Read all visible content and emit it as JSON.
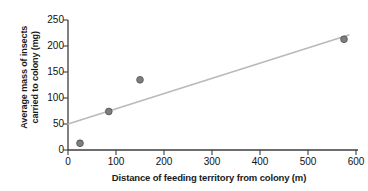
{
  "chart_data": {
    "type": "scatter",
    "title": "",
    "xlabel": "Distance of feeding territory from colony (m)",
    "ylabel_line1": "Average mass of insects",
    "ylabel_line2": "carried to colony (mg)",
    "ylabel": "Average mass of insects carried to colony (mg)",
    "xlim": [
      0,
      600
    ],
    "ylim": [
      0,
      250
    ],
    "xticks": [
      0,
      100,
      200,
      300,
      400,
      500,
      600
    ],
    "yticks": [
      0,
      50,
      100,
      150,
      200,
      250
    ],
    "xtick_labels": [
      "0",
      "100",
      "200",
      "300",
      "400",
      "500",
      "600"
    ],
    "ytick_labels": [
      "0",
      "50",
      "100",
      "150",
      "200",
      "250"
    ],
    "grid": false,
    "legend": false,
    "series": [
      {
        "name": "Observations",
        "marker": "filled-circle",
        "color": "#7d7d7d",
        "points": [
          {
            "x": 25,
            "y": 13
          },
          {
            "x": 85,
            "y": 74
          },
          {
            "x": 150,
            "y": 135
          },
          {
            "x": 575,
            "y": 213
          }
        ]
      },
      {
        "name": "Trend line",
        "type": "line",
        "color": "#b9b9b9",
        "points": [
          {
            "x": 0,
            "y": 50
          },
          {
            "x": 585,
            "y": 221
          }
        ]
      }
    ]
  },
  "axes": {
    "x_axis_name": "distance-axis",
    "y_axis_name": "mass-axis"
  }
}
